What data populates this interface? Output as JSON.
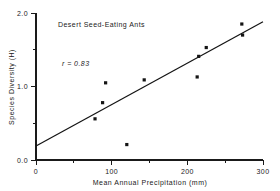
{
  "chart_data": {
    "type": "scatter",
    "title": "Desert Seed-Eating Ants",
    "xlabel": "Mean Annual Precipitation (mm)",
    "ylabel": "Species Diversity (H)",
    "xlim": [
      0,
      300
    ],
    "ylim": [
      0.0,
      2.0
    ],
    "grid": false,
    "legend": null,
    "annotations": [
      {
        "name": "correlation",
        "text": "r = 0.83"
      }
    ],
    "xticks": [
      0,
      100,
      200,
      300
    ],
    "xtick_labels": [
      "0",
      "100",
      "200",
      "300"
    ],
    "xminor_ticks": [
      50,
      150,
      250
    ],
    "yticks": [
      0.0,
      1.0,
      2.0
    ],
    "ytick_labels": [
      "0.0",
      "1.0",
      "2.0"
    ],
    "yminor_ticks": [
      0.5,
      1.5
    ],
    "marker": "square",
    "marker_color": "#141414",
    "x": [
      78,
      88,
      92,
      120,
      143,
      213,
      215,
      225,
      272,
      273
    ],
    "y": [
      0.56,
      0.78,
      1.05,
      0.21,
      1.09,
      1.13,
      1.41,
      1.53,
      1.85,
      1.7
    ],
    "points": [
      {
        "x": 78,
        "y": 0.56
      },
      {
        "x": 88,
        "y": 0.78
      },
      {
        "x": 92,
        "y": 1.05
      },
      {
        "x": 120,
        "y": 0.21
      },
      {
        "x": 143,
        "y": 1.09
      },
      {
        "x": 213,
        "y": 1.13
      },
      {
        "x": 215,
        "y": 1.41
      },
      {
        "x": 225,
        "y": 1.53
      },
      {
        "x": 272,
        "y": 1.85
      },
      {
        "x": 273,
        "y": 1.7
      }
    ],
    "trendline": {
      "name": "regression-line",
      "x0": 0,
      "y0": 0.19,
      "x1": 300,
      "y1": 1.88
    }
  }
}
